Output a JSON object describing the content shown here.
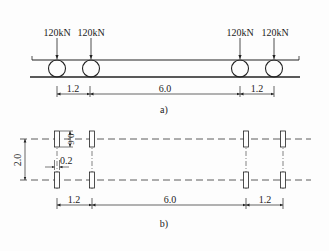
{
  "part_a": {
    "caption": "a)",
    "loads": [
      "120kN",
      "120kN",
      "120kN",
      "120kN"
    ],
    "dimensions": {
      "d1": "1.2",
      "d2": "6.0",
      "d3": "1.2"
    }
  },
  "part_b": {
    "caption": "b)",
    "track_width": "2.0",
    "pad_length": "0.6",
    "pad_width": "0.2",
    "dimensions": {
      "d1": "1.2",
      "d2": "6.0",
      "d3": "1.2"
    }
  },
  "colors": {
    "line": "#222222",
    "background": "#fdfdfd"
  }
}
